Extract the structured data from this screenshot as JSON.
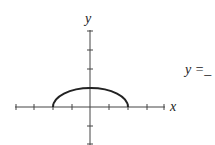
{
  "graph": {
    "x_label": "x",
    "y_label": "y",
    "x_ticks": [
      -4,
      -3,
      -2,
      -1,
      1,
      2,
      3,
      4
    ],
    "y_ticks": [
      -2,
      -1,
      1,
      2,
      3
    ],
    "curve": "upper half-ellipse from x=-2 to x=2 with peak y=1"
  },
  "answer": {
    "prefix": "y =",
    "blank": "_"
  }
}
